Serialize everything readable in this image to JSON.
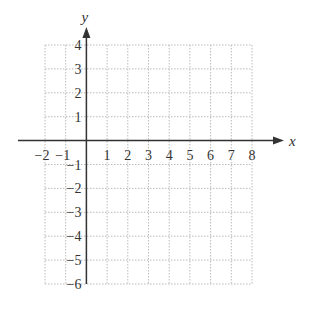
{
  "chart_data": {
    "type": "scatter",
    "title": "",
    "xlabel": "x",
    "ylabel": "y",
    "xlim": [
      -2,
      8
    ],
    "ylim": [
      -6,
      4
    ],
    "x_ticks": [
      -2,
      -1,
      1,
      2,
      3,
      4,
      5,
      6,
      7,
      8
    ],
    "y_ticks": [
      4,
      3,
      2,
      1,
      -1,
      -2,
      -3,
      -4,
      -5,
      -6
    ],
    "x_tick_labels": [
      "−2",
      "−1",
      "1",
      "2",
      "3",
      "4",
      "5",
      "6",
      "7",
      "8"
    ],
    "y_tick_labels": [
      "4",
      "3",
      "2",
      "1",
      "−1",
      "−2",
      "−3",
      "−4",
      "−5",
      "−6"
    ],
    "grid": true,
    "grid_style": "dotted",
    "series": [],
    "legend": null
  },
  "colors": {
    "axis": "#333333",
    "grid": "#bbbbbb",
    "text": "#333333"
  }
}
